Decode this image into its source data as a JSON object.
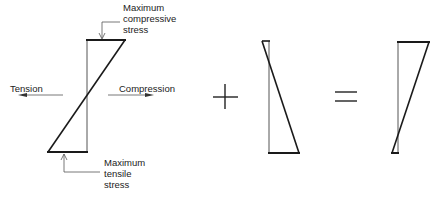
{
  "diagram": {
    "labels": {
      "max_compressive": [
        "Maximum",
        "compressive",
        "stress"
      ],
      "max_tensile": [
        "Maximum",
        "tensile",
        "stress"
      ],
      "tension": "Tension",
      "compression": "Compression"
    },
    "operators": {
      "plus": "+",
      "equals": "="
    },
    "colors": {
      "thick_line": "#1a1a1a",
      "thin_line": "#555555",
      "text": "#222222"
    },
    "panels": [
      {
        "name": "bending-stress",
        "description": "Linear bending stress distribution: compression top, tension bottom"
      },
      {
        "name": "axial-prestress",
        "description": "Triangular stress distribution added"
      },
      {
        "name": "resultant-stress",
        "description": "Combined resultant stress distribution"
      }
    ]
  }
}
